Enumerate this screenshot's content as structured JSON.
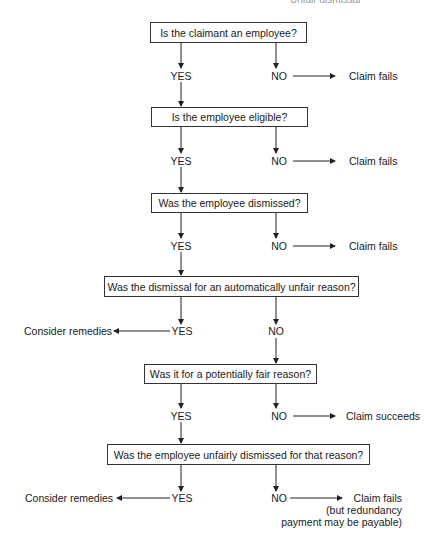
{
  "header": {
    "text": "Unfair dismissal"
  },
  "flowchart": {
    "questions": [
      {
        "id": "q1",
        "text": "Is the claimant an employee?"
      },
      {
        "id": "q2",
        "text": "Is the employee eligible?"
      },
      {
        "id": "q3",
        "text": "Was the employee dismissed?"
      },
      {
        "id": "q4",
        "text": "Was the dismissal for an automatically unfair reason?"
      },
      {
        "id": "q5",
        "text": "Was it for a potentially fair reason?"
      },
      {
        "id": "q6",
        "text": "Was the employee unfairly dismissed for that reason?"
      }
    ],
    "answers": {
      "yes": "YES",
      "no": "NO"
    },
    "outcomes": {
      "q1_no": "Claim fails",
      "q2_no": "Claim fails",
      "q3_no": "Claim fails",
      "q4_yes": "Consider remedies",
      "q5_no": "Claim succeeds",
      "q6_yes": "Consider remedies",
      "q6_no_line1": "Claim fails",
      "q6_no_line2": "(but redundancy",
      "q6_no_line3": "payment may be payable)"
    }
  },
  "colors": {
    "line": "#222222",
    "box_border": "#333333",
    "text": "#1a1a1a"
  }
}
